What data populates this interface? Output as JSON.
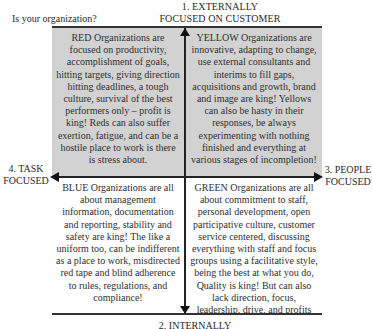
{
  "question": "Is your organization?",
  "axes": {
    "top": "1. EXTERNALLY FOCUSED ON CUSTOMER",
    "top_line1": "1. EXTERNALLY",
    "top_line2": "FOCUSED ON CUSTOMER",
    "bottom": "2. INTERNALLY",
    "right_line1": "3. PEOPLE",
    "right_line2": "FOCUSED",
    "left_line1": "4. TASK",
    "left_line2": "FOCUSED"
  },
  "quadrants": {
    "red": {
      "position": "top-left",
      "text": "RED Organizations are focused on productivity, accomplishment of goals, hitting targets, giving direction hitting deadlines, a tough culture, survival of the best performers only – profit is king! Reds can also suffer exertion, fatigue, and can be a hostile place to work is there is stress about."
    },
    "yellow": {
      "position": "top-right",
      "text": "YELLOW Organizations are innovative, adapting to change, use external consultants and interims to fill gaps, acquisitions and growth, brand and image are king! Yellows can also be hasty in their responses, be always experimenting with nothing finished and everything at various stages of incompletion!"
    },
    "blue": {
      "position": "bottom-left",
      "text": "BLUE Organizations are all about management information, documentation and reporting, stability and safety are king! The like a uniform too, can be indifferent as a place to work, misdirected red tape and blind adherence to rules, regulations, and compliance!"
    },
    "green": {
      "position": "bottom-right",
      "text": "GREEN Organizations are all about commitment to staff, personal development, open participative culture, customer service centered, discussing everything with staff and focus groups using a facilitative style, being the best at what you do, Quality is king! But can also lack direction, focus, leadership, drive, and profits"
    }
  },
  "colors": {
    "top_band": "#d2d2d2",
    "axis": "#222222",
    "text": "#2f2f2f"
  }
}
